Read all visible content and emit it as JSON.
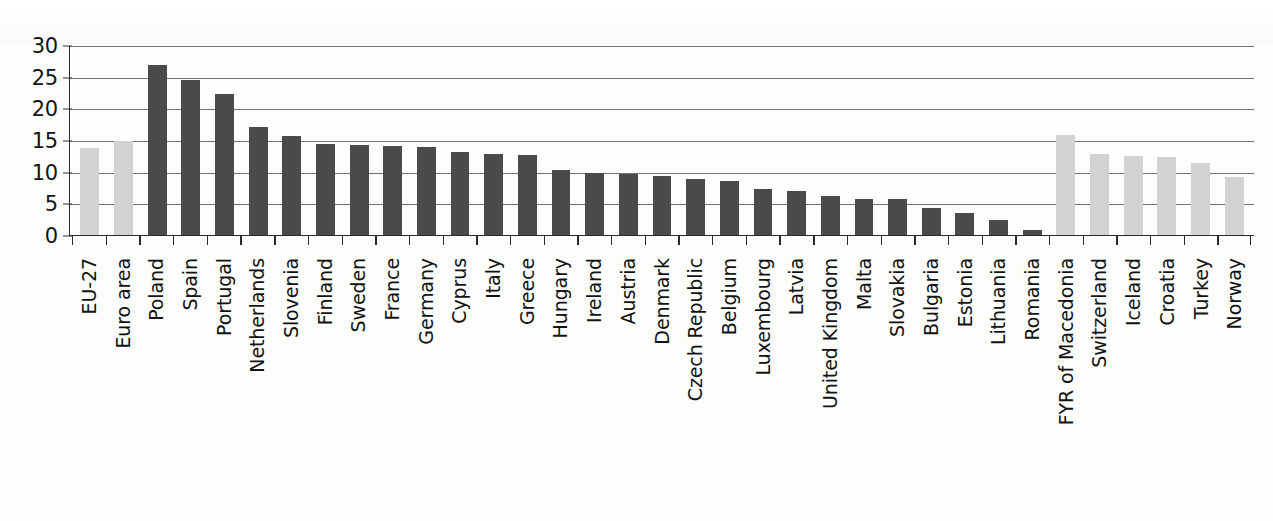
{
  "figure": {
    "background_color": "#fdfdfc",
    "bar_color_dark": "#4a4a4a",
    "bar_color_light": "#d2d2d2",
    "axis_color": "#2a2a2a",
    "gridline_color": "#585858"
  },
  "chart_data": {
    "type": "bar",
    "title": "",
    "subtitle": "",
    "xlabel": "",
    "ylabel": "",
    "ylim": [
      0,
      30
    ],
    "yticks": [
      0,
      5,
      10,
      15,
      20,
      25,
      30
    ],
    "grid": true,
    "legend_position": "none",
    "categories": [
      "EU-27",
      "Euro area",
      "Poland",
      "Spain",
      "Portugal",
      "Netherlands",
      "Slovenia",
      "Finland",
      "Sweden",
      "France",
      "Germany",
      "Cyprus",
      "Italy",
      "Greece",
      "Hungary",
      "Ireland",
      "Austria",
      "Denmark",
      "Czech Republic",
      "Belgium",
      "Luxembourg",
      "Latvia",
      "United Kingdom",
      "Malta",
      "Slovakia",
      "Bulgaria",
      "Estonia",
      "Lithuania",
      "Romania",
      "FYR of Macedonia",
      "Switzerland",
      "Iceland",
      "Croatia",
      "Turkey",
      "Norway"
    ],
    "values": [
      13.8,
      14.9,
      26.8,
      24.5,
      22.2,
      17.1,
      15.7,
      14.3,
      14.2,
      14.0,
      13.9,
      13.1,
      12.8,
      12.6,
      10.2,
      9.8,
      9.7,
      9.3,
      8.8,
      8.6,
      7.3,
      6.9,
      6.2,
      5.7,
      5.7,
      4.3,
      3.4,
      2.4,
      0.8,
      15.8,
      12.8,
      12.5,
      12.3,
      11.4,
      9.2
    ],
    "bar_styles": [
      "light",
      "light",
      "dark",
      "dark",
      "dark",
      "dark",
      "dark",
      "dark",
      "dark",
      "dark",
      "dark",
      "dark",
      "dark",
      "dark",
      "dark",
      "dark",
      "dark",
      "dark",
      "dark",
      "dark",
      "dark",
      "dark",
      "dark",
      "dark",
      "dark",
      "dark",
      "dark",
      "dark",
      "dark",
      "light",
      "light",
      "light",
      "light",
      "light",
      "light"
    ]
  }
}
